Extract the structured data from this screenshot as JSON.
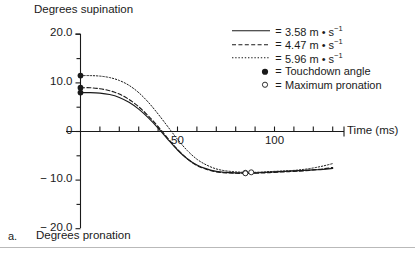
{
  "panel_label": "a.",
  "axis_titles": {
    "top_y": "Degrees supination",
    "bottom_y": "Degrees pronation",
    "x": "Time (ms)"
  },
  "legend": {
    "rows": [
      {
        "key": "solid-line",
        "eq": "=",
        "text": "3.58 m • s",
        "exp": "−1"
      },
      {
        "key": "dashed-line",
        "eq": "=",
        "text": "4.47 m • s",
        "exp": "−1"
      },
      {
        "key": "dotted-line",
        "eq": "=",
        "text": "5.96 m • s",
        "exp": "−1"
      },
      {
        "key": "filled-circle",
        "eq": "=",
        "text": "Touchdown angle",
        "exp": ""
      },
      {
        "key": "open-circle",
        "eq": "=",
        "text": "Maximum pronation",
        "exp": ""
      }
    ]
  },
  "chart_data": {
    "type": "line",
    "title": "",
    "xlabel": "Time (ms)",
    "ylabel": "Degrees supination / Degrees pronation",
    "xlim": [
      -12,
      145
    ],
    "ylim": [
      -20.0,
      20.0
    ],
    "grid": false,
    "legend_position": "top-right",
    "y_ticks_major": [
      20.0,
      10.0,
      0,
      -10.0,
      -20.0
    ],
    "y_tick_labels": [
      "20.0",
      "10.0",
      "0",
      "− 10.0",
      "− 20.0"
    ],
    "y_ticks_minor": [
      15.0,
      5.0,
      -5.0,
      -15.0
    ],
    "x_ticks_major": [
      50,
      100
    ],
    "x_tick_labels": [
      "50",
      "100"
    ],
    "x_ticks_all": [
      0,
      10,
      20,
      30,
      40,
      50,
      60,
      70,
      80,
      90,
      100,
      110,
      120,
      130
    ],
    "series": [
      {
        "name": "3.58 m • s−1",
        "style": "solid",
        "x": [
          0,
          5,
          10,
          15,
          20,
          25,
          30,
          35,
          40,
          45,
          50,
          55,
          60,
          65,
          70,
          75,
          80,
          85,
          90,
          95,
          100,
          105,
          110,
          115,
          120,
          125,
          130
        ],
        "y": [
          8.0,
          8.0,
          7.9,
          7.6,
          7.0,
          6.0,
          4.6,
          2.8,
          0.7,
          -1.6,
          -3.8,
          -5.6,
          -6.9,
          -7.7,
          -8.2,
          -8.4,
          -8.5,
          -8.5,
          -8.5,
          -8.4,
          -8.3,
          -8.2,
          -8.1,
          -8.0,
          -7.9,
          -7.8,
          -7.6
        ],
        "touchdown": {
          "x": 0,
          "y": 8.0
        },
        "max_pronation": {
          "x": 85,
          "y": -8.5
        }
      },
      {
        "name": "4.47 m • s−1",
        "style": "dashed",
        "x": [
          0,
          5,
          10,
          15,
          20,
          25,
          30,
          35,
          40,
          45,
          50,
          55,
          60,
          65,
          70,
          75,
          80,
          85,
          90,
          95,
          100,
          105,
          110,
          115,
          120,
          125,
          130
        ],
        "y": [
          9.0,
          9.0,
          8.8,
          8.4,
          7.7,
          6.6,
          5.1,
          3.2,
          1.0,
          -1.4,
          -3.7,
          -5.6,
          -7.0,
          -7.8,
          -8.3,
          -8.5,
          -8.6,
          -8.6,
          -8.6,
          -8.5,
          -8.4,
          -8.3,
          -8.2,
          -8.1,
          -7.9,
          -7.7,
          -7.4
        ],
        "touchdown": {
          "x": 0,
          "y": 9.0
        },
        "max_pronation": {
          "x": 85,
          "y": -8.6
        }
      },
      {
        "name": "5.96 m • s−1",
        "style": "dotted",
        "x": [
          0,
          5,
          10,
          15,
          20,
          25,
          30,
          35,
          40,
          45,
          50,
          55,
          60,
          65,
          70,
          75,
          80,
          85,
          90,
          95,
          100,
          105,
          110,
          115,
          120,
          125,
          130
        ],
        "y": [
          11.5,
          11.5,
          11.4,
          11.1,
          10.5,
          9.5,
          8.0,
          6.0,
          3.6,
          1.0,
          -1.6,
          -3.9,
          -5.7,
          -6.9,
          -7.7,
          -8.1,
          -8.3,
          -8.4,
          -8.4,
          -8.3,
          -8.2,
          -8.1,
          -8.0,
          -7.8,
          -7.5,
          -7.1,
          -6.6
        ],
        "touchdown": {
          "x": 0,
          "y": 11.5
        },
        "max_pronation": {
          "x": 88,
          "y": -8.4
        }
      }
    ]
  }
}
